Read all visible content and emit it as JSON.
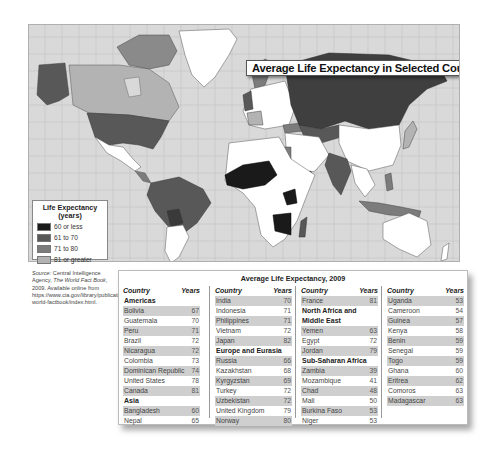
{
  "map": {
    "title": "Average Life Expectancy in Selected Countries, 2009",
    "colors": {
      "ocean": "#d9d9d9",
      "grid": "#bdbdbd",
      "no_data": "#ffffff",
      "le_60_or_less": "#1a1a1a",
      "le_61_to_70": "#585858",
      "le_71_to_80": "#7c7c7c",
      "le_81_or_greater": "#b3b3b3"
    }
  },
  "legend": {
    "title_line1": "Life Expectancy",
    "title_line2": "(years)",
    "items": [
      {
        "label": "60 or less",
        "color": "#1a1a1a"
      },
      {
        "label": "61 to 70",
        "color": "#585858"
      },
      {
        "label": "71 to 80",
        "color": "#7c7c7c"
      },
      {
        "label": "81 or greater",
        "color": "#b3b3b3"
      }
    ]
  },
  "source": {
    "label": "Source:",
    "text1": " Central Intelligence Agency, ",
    "publication": "The World Fact Book,",
    "text2": " 2009. Available online from https://www.cia.gov/library/publications/the-world-factbook/index.html."
  },
  "table": {
    "title": "Average Life Expectancy, 2009",
    "col_country": "Country",
    "col_years": "Years",
    "columns": [
      {
        "rows": [
          {
            "section": "Americas"
          },
          {
            "country": "Bolivia",
            "years": "67",
            "shaded": true
          },
          {
            "country": "Guatemala",
            "years": "70",
            "shaded": false
          },
          {
            "country": "Peru",
            "years": "71",
            "shaded": true
          },
          {
            "country": "Brazil",
            "years": "72",
            "shaded": false
          },
          {
            "country": "Nicaragua",
            "years": "72",
            "shaded": true
          },
          {
            "country": "Colombia",
            "years": "73",
            "shaded": false
          },
          {
            "country": "Dominican Republic",
            "years": "74",
            "shaded": true
          },
          {
            "country": "United States",
            "years": "78",
            "shaded": false
          },
          {
            "country": "Canada",
            "years": "81",
            "shaded": true
          },
          {
            "section": "Asia"
          },
          {
            "country": "Bangladesh",
            "years": "60",
            "shaded": true
          },
          {
            "country": "Nepal",
            "years": "65",
            "shaded": false
          }
        ]
      },
      {
        "rows": [
          {
            "country": "India",
            "years": "70",
            "shaded": true
          },
          {
            "country": "Indonesia",
            "years": "71",
            "shaded": false
          },
          {
            "country": "Philippines",
            "years": "71",
            "shaded": true
          },
          {
            "country": "Vietnam",
            "years": "72",
            "shaded": false
          },
          {
            "country": "Japan",
            "years": "82",
            "shaded": true
          },
          {
            "section": "Europe and Eurasia"
          },
          {
            "country": "Russia",
            "years": "66",
            "shaded": true
          },
          {
            "country": "Kazakhstan",
            "years": "68",
            "shaded": false
          },
          {
            "country": "Kyrgyzstan",
            "years": "69",
            "shaded": true
          },
          {
            "country": "Turkey",
            "years": "72",
            "shaded": false
          },
          {
            "country": "Uzbekistan",
            "years": "72",
            "shaded": true
          },
          {
            "country": "United Kingdom",
            "years": "79",
            "shaded": false
          },
          {
            "country": "Norway",
            "years": "80",
            "shaded": true
          }
        ]
      },
      {
        "rows": [
          {
            "country": "France",
            "years": "81",
            "shaded": true
          },
          {
            "section": "North Africa and"
          },
          {
            "section": "Middle East"
          },
          {
            "country": "Yemen",
            "years": "63",
            "shaded": true
          },
          {
            "country": "Egypt",
            "years": "72",
            "shaded": false
          },
          {
            "country": "Jordan",
            "years": "79",
            "shaded": true
          },
          {
            "section": "Sub-Saharan Africa"
          },
          {
            "country": "Zambia",
            "years": "39",
            "shaded": true
          },
          {
            "country": "Mozambique",
            "years": "41",
            "shaded": false
          },
          {
            "country": "Chad",
            "years": "48",
            "shaded": true
          },
          {
            "country": "Mali",
            "years": "50",
            "shaded": false
          },
          {
            "country": "Burkina Faso",
            "years": "53",
            "shaded": true
          },
          {
            "country": "Niger",
            "years": "53",
            "shaded": false
          }
        ]
      },
      {
        "rows": [
          {
            "country": "Uganda",
            "years": "53",
            "shaded": true
          },
          {
            "country": "Cameroon",
            "years": "54",
            "shaded": false
          },
          {
            "country": "Guinea",
            "years": "57",
            "shaded": true
          },
          {
            "country": "Kenya",
            "years": "58",
            "shaded": false
          },
          {
            "country": "Benin",
            "years": "59",
            "shaded": true
          },
          {
            "country": "Senegal",
            "years": "59",
            "shaded": false
          },
          {
            "country": "Togo",
            "years": "59",
            "shaded": true
          },
          {
            "country": "Ghana",
            "years": "60",
            "shaded": false
          },
          {
            "country": "Eritrea",
            "years": "62",
            "shaded": true
          },
          {
            "country": "Comoros",
            "years": "63",
            "shaded": false
          },
          {
            "country": "Madagascar",
            "years": "63",
            "shaded": true
          }
        ]
      }
    ]
  }
}
